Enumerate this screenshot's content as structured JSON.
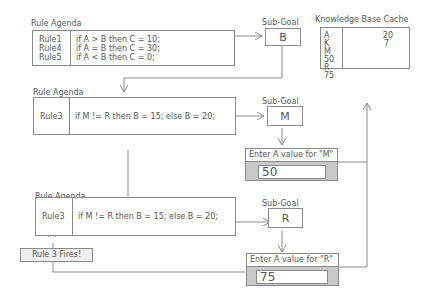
{
  "agenda1": {
    "title": "Rule Agenda",
    "rules": [
      "Rule1",
      "Rule4",
      "Rule5"
    ],
    "conditions": [
      "if A > B then C = 10;",
      "if A = B then C = 30;",
      "if A < B then C = 0;"
    ]
  },
  "subgoal1": {
    "title": "Sub-Goal",
    "value": "B"
  },
  "kb": {
    "title": "Knowledge Base Cache",
    "vars": [
      "A",
      "K",
      "M",
      "50",
      "R",
      "75"
    ],
    "vals": [
      "20",
      "7"
    ]
  },
  "agenda2": {
    "title": "Rule Agenda",
    "rule": "Rule3",
    "condition": "if M != R then B = 15; else B = 20;"
  },
  "subgoal2": {
    "title": "Sub-Goal",
    "value": "M"
  },
  "prompt1": {
    "title": "Enter A value for \"M\"",
    "value": "50"
  },
  "agenda3": {
    "title": "Rule Agenda",
    "rule": "Rule3",
    "condition": "if M != R then B = 15; else B = 20;"
  },
  "subgoal3": {
    "title": "Sub-Goal",
    "value": "R"
  },
  "prompt2": {
    "title": "Enter A value for \"R\"",
    "value": "75"
  },
  "fired": {
    "label": "Rule 3 Fires!"
  },
  "colors": {
    "line": "#8a8a8a",
    "prompt_bg": "#c9c9c9",
    "fired_bg": "#eeeeee"
  }
}
